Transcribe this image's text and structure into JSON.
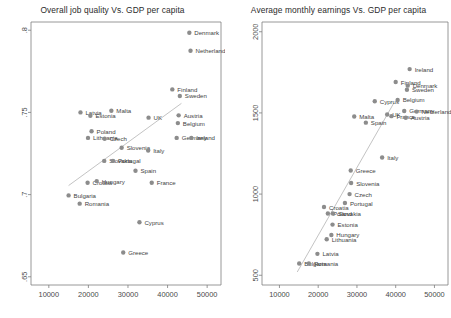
{
  "figure": {
    "background": "#ffffff",
    "point_color": "#8c8c8c",
    "fit_line_color": "#b4b4b4",
    "axis_color": "#7d7d7d"
  },
  "chart_data": [
    {
      "type": "scatter",
      "id": "job-quality",
      "title": "Overall job quality Vs. GDP per capita",
      "xlabel": "",
      "ylabel": "",
      "xlim": [
        5500,
        53500
      ],
      "ylim": [
        0.645,
        0.805
      ],
      "xticks": [
        10000,
        20000,
        30000,
        40000,
        50000
      ],
      "xticklabels": [
        "10000",
        "20000",
        "30000",
        "40000",
        "50000"
      ],
      "yticks": [
        0.65,
        0.7,
        0.75,
        0.8
      ],
      "yticklabels": [
        ".65",
        ".7",
        ".75",
        ".8"
      ],
      "grid": false,
      "legend": "none",
      "fit_line": {
        "x": [
          15000,
          43500
        ],
        "y": [
          0.7055,
          0.7555
        ]
      },
      "points": [
        {
          "label": "Denmark",
          "x": 45500,
          "y": 0.7985,
          "lab_dx": 5,
          "lab_dy": 2.5
        },
        {
          "label": "Netherland",
          "x": 45800,
          "y": 0.7875,
          "lab_dx": 5,
          "lab_dy": 2.5
        },
        {
          "label": "Finland",
          "x": 41200,
          "y": 0.764,
          "lab_dx": 5,
          "lab_dy": 2.5
        },
        {
          "label": "Sweden",
          "x": 43100,
          "y": 0.76,
          "lab_dx": 5,
          "lab_dy": 2.5
        },
        {
          "label": "Latvia",
          "x": 18000,
          "y": 0.75,
          "lab_dx": 5,
          "lab_dy": 2.5
        },
        {
          "label": "Estonia",
          "x": 20500,
          "y": 0.748,
          "lab_dx": 5,
          "lab_dy": 2.5
        },
        {
          "label": "Malta",
          "x": 25800,
          "y": 0.751,
          "lab_dx": 5,
          "lab_dy": 2.5
        },
        {
          "label": "UK",
          "x": 35200,
          "y": 0.7468,
          "lab_dx": 5,
          "lab_dy": 2.5
        },
        {
          "label": "Austria",
          "x": 42800,
          "y": 0.7482,
          "lab_dx": 5,
          "lab_dy": 2.5
        },
        {
          "label": "Belgium",
          "x": 42600,
          "y": 0.7435,
          "lab_dx": 5,
          "lab_dy": 2.5
        },
        {
          "label": "Poland",
          "x": 20800,
          "y": 0.7385,
          "lab_dx": 5,
          "lab_dy": 2.5
        },
        {
          "label": "Lithuania",
          "x": 19900,
          "y": 0.7345,
          "lab_dx": 5,
          "lab_dy": 2.5
        },
        {
          "label": "Czech",
          "x": 24100,
          "y": 0.734,
          "lab_dx": 5,
          "lab_dy": 2.5
        },
        {
          "label": "Germany",
          "x": 42300,
          "y": 0.7345,
          "lab_dx": 5,
          "lab_dy": 2.5
        },
        {
          "label": "Ireland",
          "x": 46000,
          "y": 0.7345,
          "lab_dx": 5,
          "lab_dy": 2.5
        },
        {
          "label": "Slovenia",
          "x": 28400,
          "y": 0.7285,
          "lab_dx": 5,
          "lab_dy": 2.5
        },
        {
          "label": "Italy",
          "x": 35100,
          "y": 0.7268,
          "lab_dx": 5,
          "lab_dy": 2.5
        },
        {
          "label": "Slovakia",
          "x": 24000,
          "y": 0.7205,
          "lab_dx": 5,
          "lab_dy": 2.5
        },
        {
          "label": "Portugal",
          "x": 26200,
          "y": 0.7205,
          "lab_dx": 5,
          "lab_dy": 2.5
        },
        {
          "label": "Spain",
          "x": 31900,
          "y": 0.7145,
          "lab_dx": 5,
          "lab_dy": 2.5
        },
        {
          "label": "Croatia",
          "x": 19800,
          "y": 0.7072,
          "lab_dx": 5,
          "lab_dy": 2.5
        },
        {
          "label": "Hungary",
          "x": 22100,
          "y": 0.7082,
          "lab_dx": 5,
          "lab_dy": 2.5
        },
        {
          "label": "France",
          "x": 36000,
          "y": 0.7072,
          "lab_dx": 5,
          "lab_dy": 2.5
        },
        {
          "label": "Bulgaria",
          "x": 15000,
          "y": 0.6995,
          "lab_dx": 5,
          "lab_dy": 2.5
        },
        {
          "label": "Romania",
          "x": 17800,
          "y": 0.6945,
          "lab_dx": 5,
          "lab_dy": 2.5
        },
        {
          "label": "Cyprus",
          "x": 32900,
          "y": 0.6832,
          "lab_dx": 5,
          "lab_dy": 2.5
        },
        {
          "label": "Greece",
          "x": 28800,
          "y": 0.6648,
          "lab_dx": 5,
          "lab_dy": 2.5
        }
      ]
    },
    {
      "type": "scatter",
      "id": "monthly-earnings",
      "title": "Average monthly earnings Vs. GDP per capita",
      "xlabel": "",
      "ylabel": "",
      "xlim": [
        5500,
        53500
      ],
      "ylim": [
        440,
        2060
      ],
      "xticks": [
        10000,
        20000,
        30000,
        40000,
        50000
      ],
      "xticklabels": [
        "10000",
        "20000",
        "30000",
        "40000",
        "50000"
      ],
      "yticks": [
        500,
        1000,
        1500,
        2000
      ],
      "yticklabels": [
        "500",
        "1000",
        "1500",
        "2000"
      ],
      "grid": false,
      "legend": "none",
      "fit_line": {
        "x": [
          14600,
          39500
        ],
        "y": [
          520,
          1560
        ]
      },
      "points": [
        {
          "label": "Ireland",
          "x": 43600,
          "y": 1770,
          "lab_dx": 5,
          "lab_dy": 2.5
        },
        {
          "label": "Finland",
          "x": 40000,
          "y": 1690,
          "lab_dx": 5,
          "lab_dy": 2.5
        },
        {
          "label": "Denmark",
          "x": 43100,
          "y": 1668,
          "lab_dx": 5,
          "lab_dy": 2.5
        },
        {
          "label": "Sweden",
          "x": 42900,
          "y": 1643,
          "lab_dx": 5,
          "lab_dy": 2.5
        },
        {
          "label": "Cyprus",
          "x": 34600,
          "y": 1572,
          "lab_dx": 5,
          "lab_dy": 2.5
        },
        {
          "label": "Belgium",
          "x": 40500,
          "y": 1580,
          "lab_dx": 5,
          "lab_dy": 2.5
        },
        {
          "label": "Germany",
          "x": 42200,
          "y": 1512,
          "lab_dx": 5,
          "lab_dy": 2.5
        },
        {
          "label": "Netherland",
          "x": 45400,
          "y": 1508,
          "lab_dx": 5,
          "lab_dy": 2.5
        },
        {
          "label": "UK",
          "x": 37800,
          "y": 1490,
          "lab_dx": 5,
          "lab_dy": 2.5
        },
        {
          "label": "France",
          "x": 38900,
          "y": 1480,
          "lab_dx": 5,
          "lab_dy": 2.5
        },
        {
          "label": "Austria",
          "x": 42600,
          "y": 1470,
          "lab_dx": 5,
          "lab_dy": 2.5
        },
        {
          "label": "Malta",
          "x": 29300,
          "y": 1478,
          "lab_dx": 5,
          "lab_dy": 2.5
        },
        {
          "label": "Spain",
          "x": 32300,
          "y": 1440,
          "lab_dx": 5,
          "lab_dy": 2.5
        },
        {
          "label": "Italy",
          "x": 36500,
          "y": 1225,
          "lab_dx": 5,
          "lab_dy": 2.5
        },
        {
          "label": "Greece",
          "x": 28400,
          "y": 1145,
          "lab_dx": 5,
          "lab_dy": 2.5
        },
        {
          "label": "Slovenia",
          "x": 28500,
          "y": 1068,
          "lab_dx": 5,
          "lab_dy": 2.5
        },
        {
          "label": "Czech",
          "x": 28100,
          "y": 1000,
          "lab_dx": 5,
          "lab_dy": 2.5
        },
        {
          "label": "Portugal",
          "x": 26900,
          "y": 945,
          "lab_dx": 5,
          "lab_dy": 2.5
        },
        {
          "label": "Croatia",
          "x": 21500,
          "y": 920,
          "lab_dx": 5,
          "lab_dy": 2.5
        },
        {
          "label": "Poland",
          "x": 22500,
          "y": 880,
          "lab_dx": 5,
          "lab_dy": 2.5
        },
        {
          "label": "Slovakia",
          "x": 23800,
          "y": 880,
          "lab_dx": 5,
          "lab_dy": 2.5
        },
        {
          "label": "Estonia",
          "x": 23700,
          "y": 812,
          "lab_dx": 5,
          "lab_dy": 2.5
        },
        {
          "label": "Hungary",
          "x": 23400,
          "y": 748,
          "lab_dx": 5,
          "lab_dy": 2.5
        },
        {
          "label": "Lithuania",
          "x": 22200,
          "y": 722,
          "lab_dx": 5,
          "lab_dy": 2.5
        },
        {
          "label": "Latvia",
          "x": 19800,
          "y": 632,
          "lab_dx": 5,
          "lab_dy": 2.5
        },
        {
          "label": "Bulgaria",
          "x": 15100,
          "y": 572,
          "lab_dx": 5,
          "lab_dy": 2.5
        },
        {
          "label": "Romania",
          "x": 17600,
          "y": 572,
          "lab_dx": 5,
          "lab_dy": 2.5
        }
      ]
    }
  ]
}
